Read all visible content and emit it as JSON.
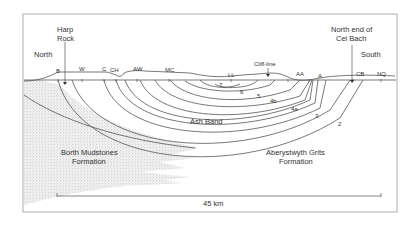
{
  "diagram": {
    "direction_left": "North",
    "direction_right": "South",
    "callouts": [
      {
        "id": "harp-rock",
        "line1": "Harp",
        "line2": "Rock"
      },
      {
        "id": "cei-bach",
        "line1": "North end of",
        "line2": "Cei Bach"
      },
      {
        "id": "cliff-line",
        "line1": "Cliff-line"
      }
    ],
    "localities": [
      "B",
      "W",
      "C",
      "CH",
      "AW",
      "MC",
      "LL",
      "AA",
      "A",
      "CB",
      "NQ"
    ],
    "units": [
      "7",
      "6",
      "5",
      "4b",
      "4a",
      "3",
      "2"
    ],
    "marker_band": "Ash Band",
    "formations": [
      {
        "line1": "Borth Mudstones",
        "line2": "Formation"
      },
      {
        "line1": "Aberystwyth Grits",
        "line2": "Formation"
      }
    ],
    "scale": {
      "label": "45 km"
    },
    "colors": {
      "line": "#555555",
      "stipple": "#bdbdbd",
      "frame": "#999999"
    }
  }
}
